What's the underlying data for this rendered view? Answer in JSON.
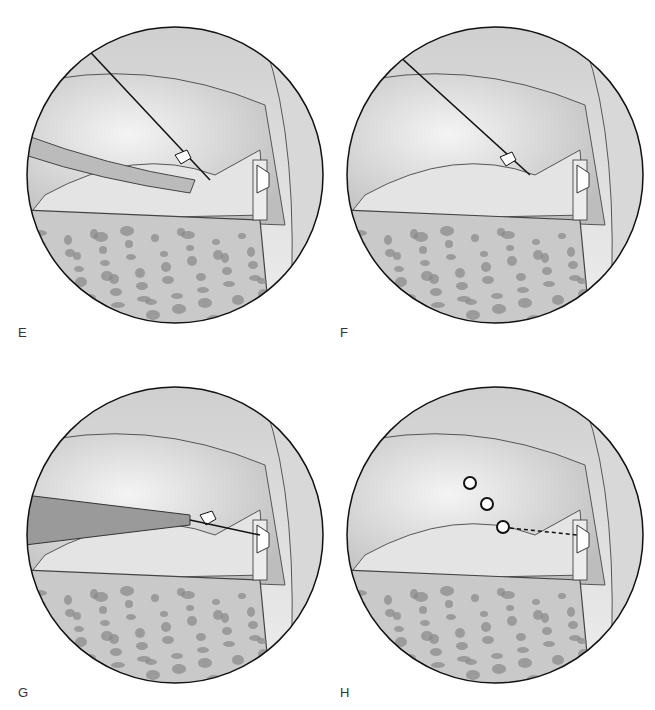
{
  "panels": [
    {
      "label": "E",
      "x": 25,
      "y": 25,
      "lx": 18,
      "ly": 335,
      "instrument": "cannula-needle"
    },
    {
      "label": "F",
      "x": 345,
      "y": 25,
      "lx": 340,
      "ly": 335,
      "instrument": "needle"
    },
    {
      "label": "G",
      "x": 25,
      "y": 385,
      "lx": 18,
      "ly": 695,
      "instrument": "pusher"
    },
    {
      "label": "H",
      "x": 345,
      "y": 385,
      "lx": 340,
      "ly": 695,
      "instrument": "implants"
    }
  ]
}
